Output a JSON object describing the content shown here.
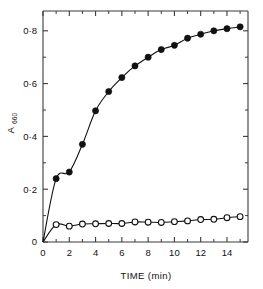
{
  "chart_data": {
    "type": "line",
    "title": "",
    "xlabel": "TIME (min)",
    "ylabel": "A660",
    "ylabel_base": "A",
    "ylabel_subscript": "660",
    "xlim": [
      0,
      15.6
    ],
    "ylim": [
      0,
      0.875
    ],
    "grid": false,
    "legend": "none",
    "xticks": [
      0,
      2,
      4,
      6,
      8,
      10,
      12,
      14
    ],
    "xtick_labels": [
      "0",
      "2",
      "4",
      "6",
      "8",
      "10",
      "12",
      "14"
    ],
    "xticks_minor": [
      1,
      3,
      5,
      7,
      9,
      11,
      13,
      15
    ],
    "yticks": [
      0,
      0.2,
      0.4,
      0.6,
      0.8
    ],
    "ytick_labels": [
      "0",
      "0·2",
      "0·4",
      "0·6",
      "0·8"
    ],
    "yticks_minor": [
      0.1,
      0.3,
      0.5,
      0.7
    ],
    "series": [
      {
        "name": "filled-circles",
        "marker": "filled-circle",
        "color": "#111111",
        "x": [
          0,
          1,
          2,
          3,
          4,
          5,
          6,
          7,
          8,
          9,
          10,
          11,
          12,
          13,
          14,
          15
        ],
        "values": [
          0.0,
          0.24,
          0.265,
          0.37,
          0.497,
          0.57,
          0.623,
          0.667,
          0.7,
          0.729,
          0.745,
          0.772,
          0.787,
          0.8,
          0.808,
          0.815
        ]
      },
      {
        "name": "open-circles",
        "marker": "open-circle",
        "color": "#111111",
        "x": [
          0,
          1,
          2,
          3,
          4,
          5,
          6,
          7,
          8,
          9,
          10,
          11,
          12,
          13,
          14,
          15
        ],
        "values": [
          0.0,
          0.066,
          0.06,
          0.068,
          0.069,
          0.07,
          0.07,
          0.076,
          0.075,
          0.074,
          0.077,
          0.08,
          0.085,
          0.086,
          0.092,
          0.096
        ]
      }
    ]
  }
}
